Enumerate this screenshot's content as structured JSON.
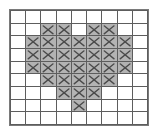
{
  "figure": {
    "title": "",
    "mark_glyph": "x-mark",
    "colors": {
      "filled_cell": "#b3b3b3",
      "empty_cell": "#ffffff",
      "grid_line": "#5d5d5d",
      "frame": "#7a7a7a",
      "mark": "#4a4a4a",
      "page_background": "#ffffff"
    }
  },
  "chart_data": {
    "type": "heatmap",
    "title": "",
    "subtitle": "",
    "xlabel": "",
    "ylabel": "",
    "rows": 9,
    "cols": 9,
    "grid": true,
    "legend": "none",
    "value_labels": {
      "0": "",
      "1": "×"
    },
    "x": [
      0,
      1,
      2,
      3,
      4,
      5,
      6,
      7,
      8
    ],
    "y": [
      0,
      1,
      2,
      3,
      4,
      5,
      6,
      7,
      8
    ],
    "xticklabels": [
      "",
      "",
      "",
      "",
      "",
      "",
      "",
      "",
      ""
    ],
    "yticklabels": [
      "",
      "",
      "",
      "",
      "",
      "",
      "",
      "",
      ""
    ],
    "values": [
      [
        0,
        0,
        0,
        0,
        0,
        0,
        0,
        0,
        0
      ],
      [
        0,
        0,
        1,
        1,
        0,
        1,
        1,
        0,
        0
      ],
      [
        0,
        1,
        1,
        1,
        1,
        1,
        1,
        1,
        0
      ],
      [
        0,
        1,
        1,
        1,
        1,
        1,
        1,
        1,
        0
      ],
      [
        0,
        1,
        1,
        1,
        1,
        1,
        1,
        1,
        0
      ],
      [
        0,
        0,
        1,
        1,
        1,
        1,
        1,
        0,
        0
      ],
      [
        0,
        0,
        0,
        1,
        1,
        1,
        0,
        0,
        0
      ],
      [
        0,
        0,
        0,
        0,
        1,
        0,
        0,
        0,
        0
      ],
      [
        0,
        0,
        0,
        0,
        0,
        0,
        0,
        0,
        0
      ]
    ],
    "filled_count": 33,
    "total_cells": 81
  }
}
